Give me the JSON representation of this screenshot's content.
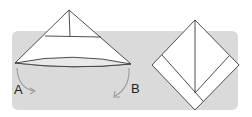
{
  "diagram": {
    "type": "origami-fold-steps",
    "colors": {
      "band": "#dadada",
      "paper": "#ffffff",
      "stroke": "#3a3a3a",
      "arrow": "#9a9a9a"
    },
    "labels": {
      "a": "A",
      "b": "B"
    },
    "steps": [
      {
        "name": "triangle-fold",
        "description": "Triangle with corners A and B to be folded down"
      },
      {
        "name": "diamond-result",
        "description": "Resulting diamond with folded strips"
      }
    ]
  }
}
